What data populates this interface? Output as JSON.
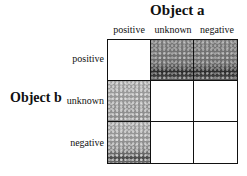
{
  "title_a": "Object a",
  "title_b": "Object b",
  "columns": [
    "positive",
    "unknown",
    "negative"
  ],
  "rows": [
    "positive",
    "unknown",
    "negative"
  ],
  "cells": [
    [
      "white",
      "dark",
      "dark"
    ],
    [
      "light",
      "white",
      "white"
    ],
    [
      "light-dark",
      "white",
      "white"
    ]
  ]
}
